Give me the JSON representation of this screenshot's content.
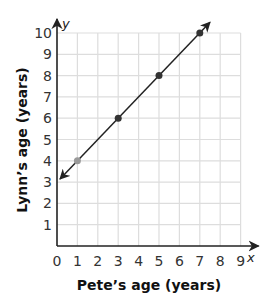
{
  "chart_data": {
    "type": "line",
    "title": "",
    "xlabel": "Pete’s age (years)",
    "ylabel": "Lynn’s age (years)",
    "x_axis_var": "x",
    "y_axis_var": "y",
    "xlim": [
      0,
      9
    ],
    "ylim": [
      0,
      10
    ],
    "x_ticks": [
      "0",
      "1",
      "2",
      "3",
      "4",
      "5",
      "6",
      "7",
      "8",
      "9"
    ],
    "y_ticks": [
      "1",
      "2",
      "3",
      "4",
      "5",
      "6",
      "7",
      "8",
      "9",
      "10"
    ],
    "grid": true,
    "line": {
      "equation": "y = x + 3",
      "arrows": "both",
      "from": [
        0,
        3
      ],
      "to": [
        7.5,
        10.5
      ]
    },
    "series": [
      {
        "name": "Lynn vs Pete",
        "x": [
          1,
          3,
          5,
          7
        ],
        "y": [
          4,
          6,
          8,
          10
        ]
      }
    ],
    "colors": {
      "line": "#222222",
      "points": "#333333",
      "highlight_point": "#9a9a9a",
      "grid": "#dddddd",
      "axis": "#222222"
    }
  }
}
